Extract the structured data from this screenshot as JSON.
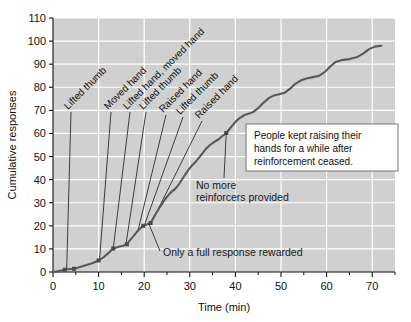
{
  "chart_data": {
    "type": "line",
    "title": "",
    "xlabel": "Time (min)",
    "ylabel": "Cumulative responses",
    "xlim": [
      0,
      75
    ],
    "ylim": [
      0,
      110
    ],
    "xticks": [
      0,
      10,
      20,
      30,
      40,
      50,
      60,
      70
    ],
    "xticklabels": [
      "0",
      "10",
      "20",
      "30",
      "40",
      "50",
      "60",
      "70"
    ],
    "xminorticks": [
      5,
      15,
      25,
      35,
      45,
      55,
      65,
      75
    ],
    "yticks": [
      0,
      10,
      20,
      30,
      40,
      50,
      60,
      70,
      80,
      90,
      100,
      110
    ],
    "yticklabels": [
      "0",
      "10",
      "20",
      "30",
      "40",
      "50",
      "60",
      "70",
      "80",
      "90",
      "100",
      "110"
    ],
    "grid": true,
    "grid_color": "#ffffff",
    "plot_bgcolor": "#d0d0d0",
    "line_color": "#595959",
    "legend": "none",
    "series": [
      {
        "name": "Cumulative responses",
        "points": [
          [
            0.0,
            0.0
          ],
          [
            1.2,
            0.4
          ],
          [
            2.6,
            1.0
          ],
          [
            3.2,
            1.2
          ],
          [
            4.6,
            1.4
          ],
          [
            5.4,
            1.8
          ],
          [
            7.0,
            2.8
          ],
          [
            8.6,
            3.8
          ],
          [
            10.0,
            5.0
          ],
          [
            11.2,
            6.6
          ],
          [
            12.4,
            8.6
          ],
          [
            13.2,
            10.2
          ],
          [
            14.6,
            11.0
          ],
          [
            15.4,
            11.4
          ],
          [
            16.2,
            12.0
          ],
          [
            16.8,
            13.6
          ],
          [
            17.6,
            15.4
          ],
          [
            18.4,
            17.4
          ],
          [
            19.2,
            19.0
          ],
          [
            19.8,
            20.0
          ],
          [
            20.6,
            20.6
          ],
          [
            21.4,
            21.2
          ],
          [
            22.2,
            24.0
          ],
          [
            23.4,
            28.0
          ],
          [
            24.6,
            31.6
          ],
          [
            25.8,
            34.4
          ],
          [
            26.8,
            36.0
          ],
          [
            27.6,
            38.0
          ],
          [
            28.6,
            41.0
          ],
          [
            29.6,
            44.0
          ],
          [
            30.6,
            46.4
          ],
          [
            31.4,
            48.0
          ],
          [
            32.4,
            50.4
          ],
          [
            33.4,
            53.0
          ],
          [
            34.4,
            55.0
          ],
          [
            35.4,
            56.4
          ],
          [
            36.4,
            57.6
          ],
          [
            37.2,
            59.0
          ],
          [
            38.0,
            60.2
          ],
          [
            39.0,
            62.6
          ],
          [
            40.0,
            65.0
          ],
          [
            41.0,
            66.8
          ],
          [
            42.0,
            68.0
          ],
          [
            43.0,
            68.6
          ],
          [
            44.0,
            69.4
          ],
          [
            45.0,
            71.0
          ],
          [
            46.2,
            73.4
          ],
          [
            47.4,
            75.4
          ],
          [
            48.4,
            76.4
          ],
          [
            49.6,
            77.0
          ],
          [
            50.8,
            77.6
          ],
          [
            52.0,
            79.4
          ],
          [
            53.2,
            81.6
          ],
          [
            54.4,
            83.0
          ],
          [
            55.6,
            83.8
          ],
          [
            57.0,
            84.4
          ],
          [
            58.4,
            85.0
          ],
          [
            59.6,
            86.6
          ],
          [
            60.8,
            89.0
          ],
          [
            62.0,
            91.0
          ],
          [
            63.4,
            91.8
          ],
          [
            65.0,
            92.2
          ],
          [
            66.6,
            93.0
          ],
          [
            68.0,
            94.6
          ],
          [
            69.4,
            96.6
          ],
          [
            70.6,
            97.6
          ],
          [
            72.0,
            98.0
          ]
        ]
      }
    ],
    "markers": [
      [
        2.6,
        1.0
      ],
      [
        4.6,
        1.4
      ],
      [
        10.0,
        5.0
      ],
      [
        13.2,
        10.2
      ],
      [
        16.2,
        12.0
      ],
      [
        19.8,
        20.0
      ],
      [
        21.4,
        21.2
      ],
      [
        38.0,
        60.2
      ]
    ],
    "event_labels": [
      {
        "text": "Lifted thumb",
        "anchor_x": 3.0,
        "anchor_y": 1.2
      },
      {
        "text": "Moved hand",
        "anchor_x": 10.2,
        "anchor_y": 5.2
      },
      {
        "text": "Lifted hand, moved hand",
        "anchor_x": 13.2,
        "anchor_y": 10.0
      },
      {
        "text": "Lifted thumb",
        "anchor_x": 16.0,
        "anchor_y": 12.0
      },
      {
        "text": "Raised hand",
        "anchor_x": 18.6,
        "anchor_y": 17.6
      },
      {
        "text": "Lifted thumb",
        "anchor_x": 20.0,
        "anchor_y": 20.0
      },
      {
        "text": "Raised hand",
        "anchor_x": 21.6,
        "anchor_y": 21.4
      }
    ],
    "annotations": [
      {
        "name": "no-more-reinforcers",
        "lines": [
          "No more",
          "reinforcers provided"
        ],
        "anchor_x": 38.0,
        "anchor_y": 60.2
      },
      {
        "name": "only-full-response",
        "lines": [
          "Only a full response rewarded"
        ],
        "anchor_x": 21.0,
        "anchor_y": 21.0
      }
    ],
    "callout_box": {
      "lines": [
        "People kept raising their",
        "hands for a while after",
        "reinforcement ceased."
      ],
      "border_color": "#777777",
      "background": "#ffffff"
    }
  }
}
